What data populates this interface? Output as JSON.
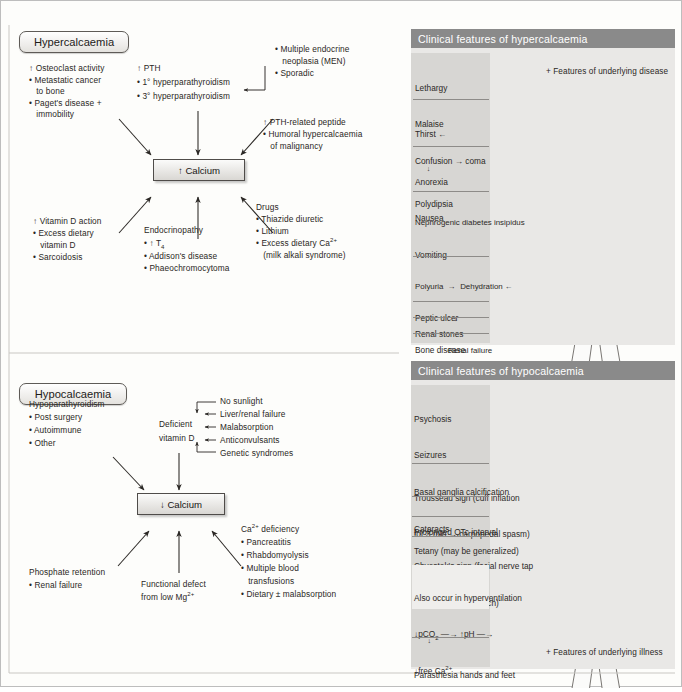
{
  "page": {
    "background": "#fdfdfb",
    "border_color": "#bdbdbd"
  },
  "hypercalcaemia": {
    "title": "Hypercalcaemia",
    "central_box": "↑ Calcium",
    "causes": {
      "osteoclast": {
        "heading": "↑ Osteoclast activity",
        "items": [
          "• Metastatic cancer",
          "   to bone",
          "• Paget's disease +",
          "   immobility"
        ]
      },
      "pth": {
        "heading": "↑ PTH",
        "items": [
          "• 1° hyperparathyroidism",
          "• 3° hyperparathyroidism"
        ]
      },
      "men": {
        "items": [
          "• Multiple endocrine",
          "   neoplasia (MEN)",
          "• Sporadic"
        ]
      },
      "pthrp": {
        "heading": "↑ PTH-related peptide",
        "items": [
          "• Humoral hypercalcaemia",
          "   of malignancy"
        ]
      },
      "vitamind": {
        "heading": "↑ Vitamin D action",
        "items": [
          "• Excess dietary",
          "   vitamin D",
          "• Sarcoidosis"
        ]
      },
      "endocrinopathy": {
        "heading": "Endocrinopathy",
        "items": [
          "• ↑ T4",
          "• Addison's disease",
          "• Phaeochromocytoma"
        ]
      },
      "drugs": {
        "heading": "Drugs",
        "items": [
          "• Thiazide diuretic",
          "• Lithium",
          "• Excess dietary Ca2+",
          "   (milk alkali syndrome)"
        ]
      }
    },
    "clinical_panel": {
      "header": "Clinical features of hypercalcaemia",
      "underlying": "+ Features of underlying disease",
      "groups": [
        {
          "lines": [
            "Lethargy",
            "Malaise",
            "Confusion → coma"
          ]
        },
        {
          "lines": [
            "Thirst ←",
            "      ↓",
            "Polydipsia"
          ]
        },
        {
          "lines": [
            "Anorexia",
            "Nausea",
            "Vomiting"
          ]
        },
        {
          "lines": [
            "Nephrogenic diabetes insipidus",
            "      ↓",
            "Polyuria  →  Dehydration ←",
            "                    ↓",
            "               Renal failure"
          ]
        },
        {
          "lines": [
            "Peptic ulcer"
          ]
        },
        {
          "lines": [
            "Renal stones"
          ]
        },
        {
          "lines": [
            "Bone disease"
          ]
        }
      ]
    }
  },
  "hypocalcaemia": {
    "title": "Hypocalcaemia",
    "central_box": "↓ Calcium",
    "causes": {
      "hypopara": {
        "heading": "Hypoparathyroidism",
        "items": [
          "• Post surgery",
          "• Autoimmune",
          "• Other"
        ]
      },
      "deficient_vit_d": {
        "heading_line1": "Deficient",
        "heading_line2": "vitamin D",
        "items": [
          "No sunlight",
          "Liver/renal failure",
          "Malabsorption",
          "Anticonvulsants",
          "Genetic syndromes"
        ]
      },
      "phosphate": {
        "heading": "Phosphate retention",
        "items": [
          "• Renal failure"
        ]
      },
      "magnesium": {
        "line1": "Functional defect",
        "line2": "from low Mg2+"
      },
      "ca_deficiency": {
        "heading": "Ca2+ deficiency",
        "items": [
          "• Pancreatitis",
          "• Rhabdomyolysis",
          "• Multiple blood",
          "   transfusions",
          "• Dietary ± malabsorption"
        ]
      }
    },
    "clinical_panel": {
      "header": "Clinical features of hypocalcaemia",
      "underlying": "+ Features of underlying illness",
      "groups": [
        {
          "lines": [
            "Psychosis",
            "Seizures",
            "Basal ganglia calcification",
            "Cataracts",
            "Chvostek's sign (facial nerve tap",
            "→ facial muscle twitch)"
          ]
        },
        {
          "lines": [
            "Trousseau sign (cuff inflation",
            "for 3 min → carpopedal spasm)"
          ]
        },
        {
          "lines": [
            "Prolonged QTc interval"
          ]
        },
        {
          "lines": [
            "Tetany (may be generalized)"
          ]
        },
        {
          "lines": [
            "Carpopedal spasm",
            "       ↓"
          ]
        },
        {
          "lines": [
            "Also occur in hyperventilation",
            "↓pCO2  —→ ↑pH  —→",
            "↓free Ca2+"
          ]
        },
        {
          "lines": [
            "       ↓",
            "Parasthesia hands and feet"
          ]
        }
      ]
    }
  },
  "colors": {
    "panel_header_bg": "#8a8a8a",
    "panel_body_bg": "#d7d6d3",
    "panel_outer_bg": "#e9e8e6",
    "organ_dark": "#4a4745",
    "line": "#6d6a66"
  }
}
